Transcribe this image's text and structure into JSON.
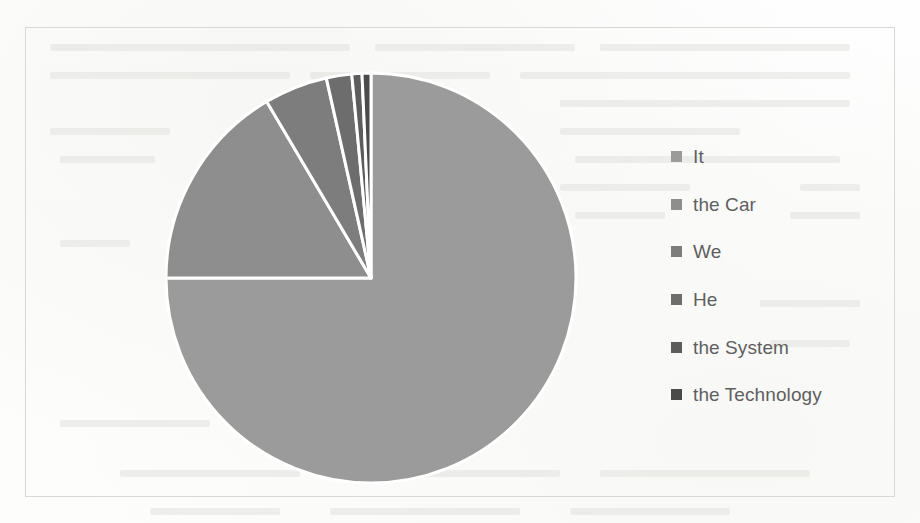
{
  "page": {
    "background_color": "#fdfdfc",
    "frame_border_color": "#d8d8d4"
  },
  "legend": {
    "position": "right",
    "items": [
      {
        "label": "It",
        "color": "#9b9b9b"
      },
      {
        "label": "the Car",
        "color": "#8e8e8e"
      },
      {
        "label": "We",
        "color": "#7d7d7d"
      },
      {
        "label": "He",
        "color": "#6d6d6d"
      },
      {
        "label": "the System",
        "color": "#5c5c5c"
      },
      {
        "label": "the Technology",
        "color": "#4a4a4a"
      }
    ]
  },
  "chart_data": {
    "type": "pie",
    "title": "",
    "subtitle": "",
    "xlabel": "",
    "ylabel": "",
    "grid": false,
    "legend_position": "right",
    "start_angle_deg": 0,
    "direction": "clockwise",
    "categories": [
      "It",
      "the Car",
      "We",
      "He",
      "the System",
      "the Technology"
    ],
    "values": [
      75.0,
      16.5,
      5.0,
      2.0,
      0.8,
      0.7
    ],
    "unit": "percent",
    "colors": [
      "#9b9b9b",
      "#8e8e8e",
      "#7d7d7d",
      "#6d6d6d",
      "#5c5c5c",
      "#4a4a4a"
    ],
    "slice_separator_color": "#ffffff",
    "geometry": {
      "center_x": 345,
      "center_y": 250,
      "radius": 205
    }
  },
  "ghost_text": {
    "description": "faint show-through text from the reverse side of the scanned page"
  }
}
